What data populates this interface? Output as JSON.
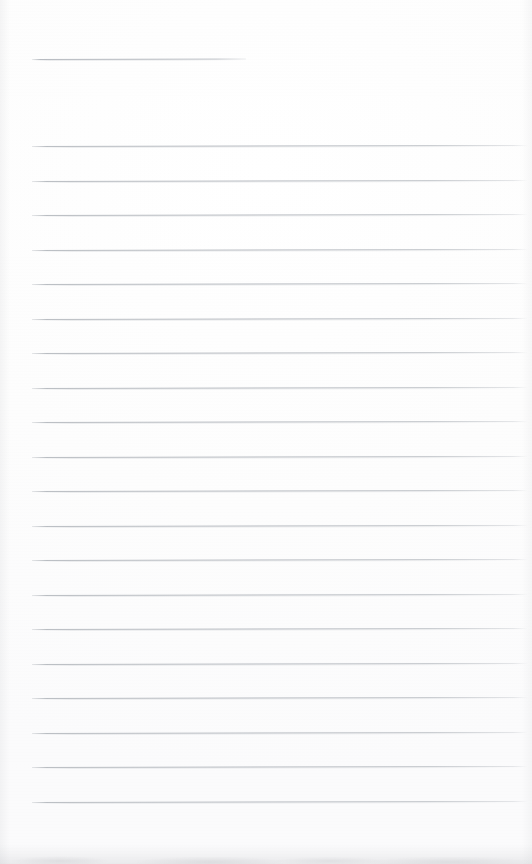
{
  "document": {
    "kind": "scanned-blank-lined-page",
    "page_width": 532,
    "page_height": 864,
    "background_color": "#fdfdfd",
    "rule_color": "#b9bdc2",
    "has_visible_text": false,
    "text_content": ""
  },
  "rules": {
    "left_x": 32,
    "right_x": 528,
    "thickness_px": 1,
    "spacing_px": 34.7,
    "tilt_deg": -0.11,
    "header_rule": {
      "y": 59,
      "left_x": 32,
      "right_x": 246,
      "width": 214,
      "label": "header-rule"
    },
    "body_rules": [
      {
        "y": 146
      },
      {
        "y": 181
      },
      {
        "y": 215
      },
      {
        "y": 250
      },
      {
        "y": 284
      },
      {
        "y": 319
      },
      {
        "y": 353
      },
      {
        "y": 388
      },
      {
        "y": 422
      },
      {
        "y": 457
      },
      {
        "y": 491
      },
      {
        "y": 526
      },
      {
        "y": 560
      },
      {
        "y": 595
      },
      {
        "y": 629
      },
      {
        "y": 664
      },
      {
        "y": 698
      },
      {
        "y": 733
      },
      {
        "y": 767
      },
      {
        "y": 802
      }
    ],
    "body_rule_count": 20,
    "total_rule_count": 21
  },
  "artifacts": {
    "bottom_smudge": {
      "label": "bottom-edge-scan-smudge",
      "top_y": 846,
      "height": 18,
      "color": "#a6a8ae"
    },
    "left_edge_shade": {
      "width": 10,
      "color": "#b4b6ba"
    },
    "right_edge_shade": {
      "width": 10,
      "color": "#b4b6ba"
    }
  }
}
